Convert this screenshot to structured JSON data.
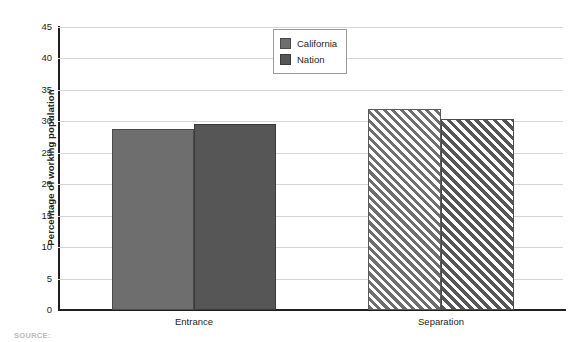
{
  "chart_data": {
    "type": "bar",
    "title": "",
    "xlabel": "",
    "ylabel": "Percentage of working population",
    "categories": [
      "Entrance",
      "Separation"
    ],
    "series": [
      {
        "name": "California",
        "values": [
          28.8,
          32.0
        ]
      },
      {
        "name": "Nation",
        "values": [
          29.5,
          30.3
        ]
      }
    ],
    "ylim": [
      0,
      45
    ],
    "yticks": [
      0,
      5,
      10,
      15,
      20,
      25,
      30,
      35,
      40,
      45
    ],
    "ytick_labels": [
      "0",
      "5",
      "10",
      "15",
      "20",
      "25",
      "30",
      "35",
      "40",
      "45"
    ],
    "grid": true,
    "legend_position": "top-center",
    "legend_entries": [
      "California",
      "Nation"
    ],
    "colors": {
      "california": "#6e6e6e",
      "nation": "#565656",
      "gridline": "#d5d5d5",
      "axis": "#231f20",
      "background": "#ffffff"
    },
    "fill_styles": {
      "Entrance": "solid",
      "Separation": "diagonal-hatch"
    }
  },
  "source_note": "SOURCE:"
}
